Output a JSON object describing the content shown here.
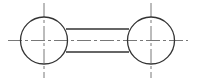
{
  "diagram": {
    "type": "technical-drawing",
    "canvas": {
      "width": 198,
      "height": 81,
      "background": "#ffffff"
    },
    "colors": {
      "outline": "#333333",
      "centerline": "#555555"
    },
    "stroke": {
      "outline_width": 1.3,
      "centerline_width": 0.8,
      "centerline_dash": "14 3 3 3"
    },
    "circles": [
      {
        "id": "left-circle",
        "cx": 44,
        "cy": 40.5,
        "r": 23.5
      },
      {
        "id": "right-circle",
        "cx": 151,
        "cy": 40.5,
        "r": 23.5
      }
    ],
    "bar": {
      "x1": 66,
      "x2": 129,
      "top_y": 29,
      "bottom_y": 52
    },
    "centerlines": {
      "horizontal": {
        "x1": 8,
        "x2": 188,
        "y": 40.5
      },
      "vertical": [
        {
          "x": 44,
          "y1": 3,
          "y2": 78
        },
        {
          "x": 151,
          "y1": 3,
          "y2": 78
        }
      ]
    }
  }
}
